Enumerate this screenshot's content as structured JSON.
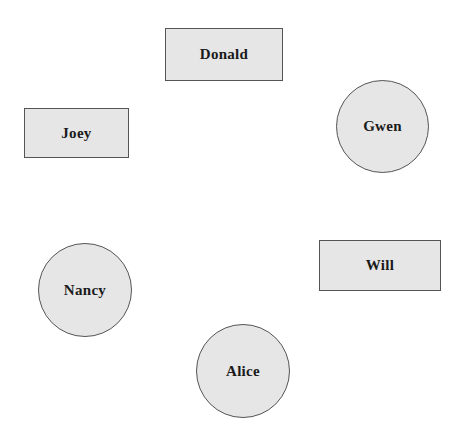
{
  "diagram": {
    "fill_color": "#e6e6e6",
    "border_color": "#555555",
    "text_color": "#1a1a1a",
    "nodes": [
      {
        "label": "Donald",
        "shape": "rectangle"
      },
      {
        "label": "Joey",
        "shape": "rectangle"
      },
      {
        "label": "Gwen",
        "shape": "circle"
      },
      {
        "label": "Will",
        "shape": "rectangle"
      },
      {
        "label": "Nancy",
        "shape": "circle"
      },
      {
        "label": "Alice",
        "shape": "circle"
      }
    ]
  }
}
